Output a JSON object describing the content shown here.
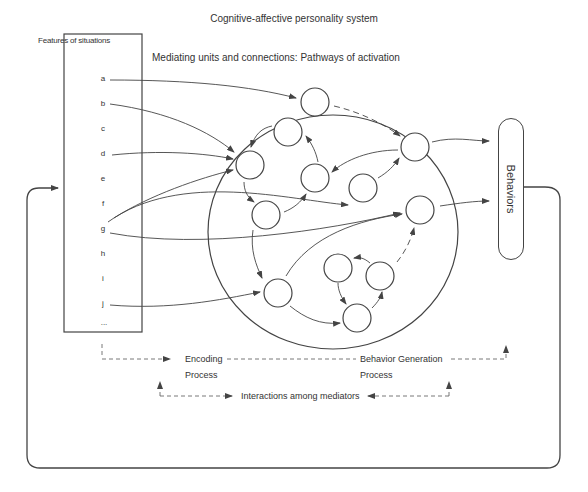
{
  "title": "Cognitive-affective personality system",
  "subtitle": "Mediating units and connections: Pathways of activation",
  "features_box": {
    "title": "Features of situations",
    "items": [
      "a",
      "b",
      "c",
      "d",
      "e",
      "f",
      "g",
      "h",
      "i",
      "j",
      "..."
    ]
  },
  "behaviors_label": "Behaviors",
  "processes": {
    "encoding_line1": "Encoding",
    "encoding_line2": "Process",
    "behavior_gen_line1": "Behavior Generation",
    "behavior_gen_line2": "Process",
    "interactions": "Interactions among mediators"
  },
  "colors": {
    "line": "#444444",
    "text": "#333333",
    "background": "#ffffff"
  },
  "diagram": {
    "mediating_units_count": 12,
    "feature_inputs": [
      "a",
      "b",
      "d",
      "f",
      "g",
      "j"
    ],
    "outputs_to_behaviors": 2,
    "feedback_loop": "Behaviors back to Features of situations"
  }
}
